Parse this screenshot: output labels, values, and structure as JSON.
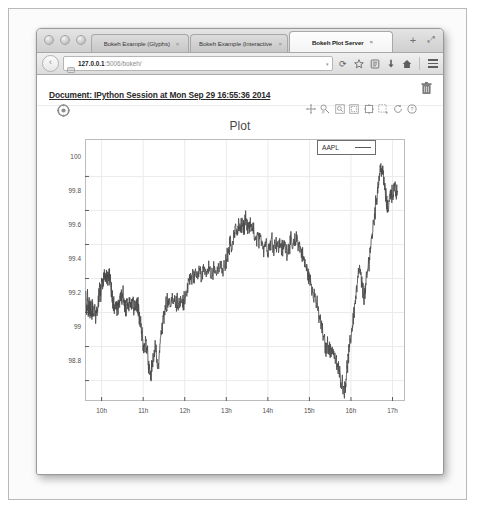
{
  "window": {
    "traffic_lights": [
      "close",
      "minimize",
      "zoom"
    ],
    "maximize_label": "⤢",
    "newtab_label": "+"
  },
  "tabs": [
    {
      "label": "Bokeh Example (Glyphs)",
      "close": "×",
      "active": false
    },
    {
      "label": "Bokeh Example (Interactive)",
      "close": "×",
      "active": false
    },
    {
      "label": "Bokeh Plot Server",
      "close": "×",
      "active": true
    }
  ],
  "navbar": {
    "back_label": "‹",
    "reload_label": "⟳",
    "url_host": "127.0.0.1",
    "url_rest": ":5006/bokeh/",
    "dropdown_caret": "▾",
    "icons": [
      "bookmark-star-icon",
      "reader-icon",
      "downloads-icon",
      "home-icon",
      "menu-icon"
    ]
  },
  "document": {
    "title": "Document: IPython Session at Mon Sep 29 16:55:36 2014",
    "delete_icon": "trash-icon"
  },
  "plot_toolbar": {
    "logo": "bokeh-logo",
    "tools": [
      "pan-tool",
      "wheel-zoom-tool",
      "box-zoom-tool",
      "box-select-tool",
      "crosshair-tool",
      "lasso-select-tool",
      "reset-tool",
      "help-tool"
    ]
  },
  "colors": {
    "line": "#4a4a4a",
    "grid": "#e8e8e8",
    "axis": "#5c5c5c",
    "title": "#4a4a4a",
    "page_bg": "#ffffff"
  },
  "chart_data": {
    "type": "line",
    "title": "Plot",
    "xlabel": "",
    "ylabel": "",
    "legend": [
      {
        "name": "AAPL",
        "color": "#4a4a4a"
      }
    ],
    "legend_position": "top-right",
    "grid": true,
    "xlim": [
      9.6,
      17.3
    ],
    "ylim": [
      98.68,
      100.22
    ],
    "xticks": [
      "10h",
      "11h",
      "12h",
      "13h",
      "14h",
      "15h",
      "16h",
      "17h"
    ],
    "xtick_values": [
      10,
      11,
      12,
      13,
      14,
      15,
      16,
      17
    ],
    "yticks": [
      "100",
      "99.8",
      "99.6",
      "99.4",
      "99.2",
      "99",
      "98.8"
    ],
    "ytick_values": [
      100,
      99.8,
      99.6,
      99.4,
      99.2,
      99,
      98.8
    ],
    "series": [
      {
        "name": "AAPL",
        "x": [
          9.62,
          9.64,
          9.66,
          9.68,
          9.7,
          9.72,
          9.74,
          9.76,
          9.78,
          9.8,
          9.83,
          9.86,
          9.89,
          9.92,
          9.95,
          9.98,
          10.01,
          10.04,
          10.07,
          10.1,
          10.13,
          10.16,
          10.19,
          10.22,
          10.25,
          10.28,
          10.31,
          10.34,
          10.37,
          10.4,
          10.43,
          10.46,
          10.49,
          10.52,
          10.55,
          10.58,
          10.61,
          10.64,
          10.67,
          10.7,
          10.74,
          10.78,
          10.82,
          10.86,
          10.9,
          10.94,
          10.98,
          11.02,
          11.06,
          11.1,
          11.14,
          11.18,
          11.22,
          11.26,
          11.3,
          11.34,
          11.38,
          11.42,
          11.46,
          11.5,
          11.55,
          11.6,
          11.65,
          11.7,
          11.75,
          11.8,
          11.85,
          11.9,
          11.95,
          12.0,
          12.05,
          12.1,
          12.15,
          12.2,
          12.25,
          12.3,
          12.35,
          12.4,
          12.45,
          12.5,
          12.56,
          12.62,
          12.68,
          12.74,
          12.8,
          12.86,
          12.92,
          12.98,
          13.02,
          13.06,
          13.1,
          13.14,
          13.18,
          13.22,
          13.26,
          13.3,
          13.34,
          13.38,
          13.42,
          13.46,
          13.5,
          13.55,
          13.6,
          13.65,
          13.7,
          13.75,
          13.8,
          13.85,
          13.9,
          13.95,
          14.0,
          14.05,
          14.1,
          14.15,
          14.2,
          14.25,
          14.3,
          14.35,
          14.4,
          14.45,
          14.5,
          14.55,
          14.6,
          14.65,
          14.7,
          14.75,
          14.8,
          14.85,
          14.9,
          14.95,
          15.0,
          15.05,
          15.1,
          15.15,
          15.2,
          15.25,
          15.3,
          15.35,
          15.4,
          15.45,
          15.5,
          15.55,
          15.6,
          15.65,
          15.7,
          15.75,
          15.8,
          15.85,
          15.88,
          15.92,
          15.96,
          16.0,
          16.04,
          16.08,
          16.12,
          16.16,
          16.2,
          16.24,
          16.28,
          16.32,
          16.36,
          16.4,
          16.44,
          16.48,
          16.52,
          16.56,
          16.6,
          16.64,
          16.68,
          16.72,
          16.76,
          16.8,
          16.84,
          16.88,
          16.92,
          16.96,
          17.0,
          17.04,
          17.08,
          17.12
        ],
        "y": [
          99.28,
          99.22,
          99.31,
          99.2,
          99.27,
          99.18,
          99.25,
          99.17,
          99.24,
          99.19,
          99.22,
          99.17,
          99.2,
          99.26,
          99.34,
          99.3,
          99.41,
          99.36,
          99.44,
          99.38,
          99.43,
          99.39,
          99.41,
          99.35,
          99.3,
          99.26,
          99.22,
          99.24,
          99.2,
          99.23,
          99.27,
          99.3,
          99.28,
          99.32,
          99.25,
          99.22,
          99.26,
          99.24,
          99.27,
          99.25,
          99.26,
          99.24,
          99.26,
          99.25,
          99.19,
          99.12,
          99.05,
          98.98,
          99.04,
          98.96,
          98.88,
          98.82,
          98.9,
          98.95,
          99.0,
          98.86,
          98.93,
          99.05,
          99.12,
          99.18,
          99.24,
          99.26,
          99.25,
          99.26,
          99.27,
          99.26,
          99.25,
          99.27,
          99.26,
          99.28,
          99.33,
          99.38,
          99.42,
          99.4,
          99.44,
          99.41,
          99.45,
          99.43,
          99.46,
          99.44,
          99.47,
          99.45,
          99.43,
          99.46,
          99.44,
          99.47,
          99.45,
          99.48,
          99.52,
          99.56,
          99.62,
          99.58,
          99.64,
          99.7,
          99.66,
          99.72,
          99.67,
          99.73,
          99.69,
          99.74,
          99.7,
          99.68,
          99.72,
          99.69,
          99.6,
          99.66,
          99.61,
          99.64,
          99.58,
          99.62,
          99.57,
          99.6,
          99.63,
          99.59,
          99.62,
          99.58,
          99.61,
          99.57,
          99.6,
          99.56,
          99.59,
          99.62,
          99.58,
          99.61,
          99.64,
          99.6,
          99.56,
          99.52,
          99.48,
          99.44,
          99.4,
          99.36,
          99.32,
          99.28,
          99.22,
          99.16,
          99.1,
          99.04,
          98.98,
          99.02,
          98.96,
          99.0,
          98.94,
          98.9,
          98.86,
          98.82,
          98.78,
          98.74,
          98.82,
          98.9,
          98.98,
          99.06,
          99.14,
          99.22,
          99.3,
          99.38,
          99.46,
          99.4,
          99.34,
          99.28,
          99.36,
          99.44,
          99.52,
          99.6,
          99.68,
          99.76,
          99.84,
          99.92,
          100.0,
          100.06,
          100.02,
          99.96,
          99.88,
          99.8,
          99.86,
          99.92,
          99.89,
          99.93,
          99.9,
          99.91
        ]
      }
    ]
  }
}
